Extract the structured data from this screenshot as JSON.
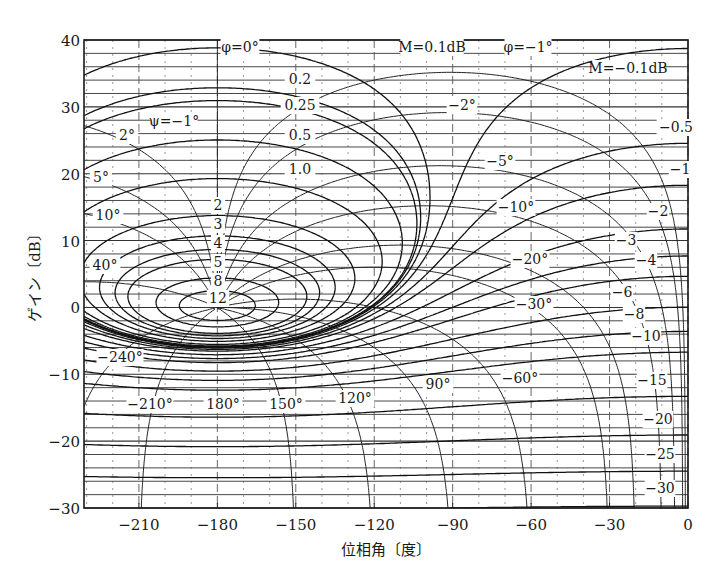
{
  "chart_data": {
    "type": "line",
    "title": "",
    "subtitle": "Nichols chart",
    "xlabel": "位相角〔度〕",
    "ylabel": "ゲイン〔dB〕",
    "xlim": [
      -231,
      0
    ],
    "ylim": [
      -30,
      40
    ],
    "x_ticks": [
      -210,
      -180,
      -150,
      -120,
      -90,
      -60,
      -30,
      0
    ],
    "x_tick_labels": [
      "−210",
      "−180",
      "−150",
      "−120",
      "−90",
      "−60",
      "−30",
      "0"
    ],
    "y_ticks": [
      -30,
      -20,
      -10,
      0,
      10,
      20,
      30,
      40
    ],
    "y_tick_labels": [
      "−30",
      "−20",
      "−10",
      "0",
      "10",
      "20",
      "30",
      "40"
    ],
    "grid": true,
    "m_contours_db": [
      0.1,
      0.2,
      0.25,
      0.5,
      1.0,
      2,
      3,
      4,
      5,
      8,
      12,
      -0.1,
      -0.5,
      -1,
      -2,
      -3,
      -4,
      -6,
      -8,
      -10,
      -15,
      -20,
      -25,
      -30
    ],
    "n_contours_deg": [
      0,
      -1,
      -2,
      -5,
      -10,
      -20,
      -30,
      -60,
      -90,
      -120,
      -150,
      -180,
      -210,
      -240,
      40,
      10,
      5,
      2
    ],
    "annotations": {
      "m_labels": [
        {
          "text": "M=0.1dB"
        },
        {
          "text": "0.2"
        },
        {
          "text": "0.25"
        },
        {
          "text": "0.5"
        },
        {
          "text": "1.0"
        },
        {
          "text": "2"
        },
        {
          "text": "3"
        },
        {
          "text": "4"
        },
        {
          "text": "5"
        },
        {
          "text": "8"
        },
        {
          "text": "12"
        },
        {
          "text": "M=−0.1dB"
        },
        {
          "text": "−0.5"
        },
        {
          "text": "−1"
        },
        {
          "text": "−2"
        },
        {
          "text": "−3"
        },
        {
          "text": "−4"
        },
        {
          "text": "−6"
        },
        {
          "text": "−8"
        },
        {
          "text": "−10"
        },
        {
          "text": "−15"
        },
        {
          "text": "−20"
        },
        {
          "text": "−25"
        },
        {
          "text": "−30"
        }
      ],
      "n_labels": [
        {
          "text": "φ=0°"
        },
        {
          "text": "φ=−1°"
        },
        {
          "text": "ψ=−1°"
        },
        {
          "text": "−2°"
        },
        {
          "text": "2°"
        },
        {
          "text": "5°"
        },
        {
          "text": "−5°"
        },
        {
          "text": "10°"
        },
        {
          "text": "−10°"
        },
        {
          "text": "40°"
        },
        {
          "text": "−20°"
        },
        {
          "text": "−30°"
        },
        {
          "text": "−240°"
        },
        {
          "text": "−60°"
        },
        {
          "text": "90°"
        },
        {
          "text": "−210°"
        },
        {
          "text": "180°"
        },
        {
          "text": "150°"
        },
        {
          "text": "120°"
        }
      ]
    }
  }
}
